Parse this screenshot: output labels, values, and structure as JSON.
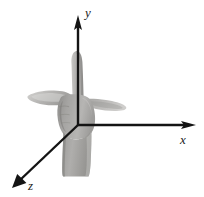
{
  "figure": {
    "width": 204,
    "height": 197,
    "background_color": "#ffffff"
  },
  "axes": {
    "origin": {
      "x": 78,
      "y": 125
    },
    "color": "#141414",
    "items": [
      {
        "name": "y",
        "label": "y",
        "direction": "up",
        "tip": {
          "x": 78,
          "y": 16
        },
        "label_position": {
          "x": 85,
          "y": 6
        }
      },
      {
        "name": "x",
        "label": "x",
        "direction": "right",
        "tip": {
          "x": 196,
          "y": 125
        },
        "label_position": {
          "x": 180,
          "y": 133
        }
      },
      {
        "name": "z",
        "label": "z",
        "direction": "down-left",
        "tip": {
          "x": 12,
          "y": 188
        },
        "label_position": {
          "x": 28,
          "y": 179
        }
      }
    ]
  },
  "hand": {
    "name": "right-hand-photograph",
    "rendering": "grayscale-photo",
    "tones": {
      "highlight": "#d4d3d1",
      "midtone": "#a9a8a6",
      "shadow": "#8c8b89",
      "deep_shadow": "#757472"
    },
    "parts": [
      {
        "name": "index-finger-up",
        "points_along_axis": "y"
      },
      {
        "name": "thumb-left",
        "points_along_axis": "z"
      },
      {
        "name": "middle-finger-right",
        "points_along_axis": "x"
      },
      {
        "name": "palm",
        "points_along_axis": null
      },
      {
        "name": "wrist",
        "points_along_axis": null
      }
    ]
  }
}
